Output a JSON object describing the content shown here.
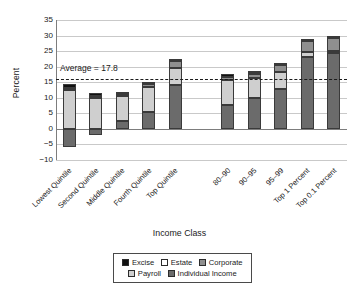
{
  "chart_data": {
    "type": "bar",
    "subtype": "stacked-bar",
    "title": "",
    "xlabel": "Income Class",
    "ylabel": "Percent",
    "ylim": [
      -10,
      35
    ],
    "ytick_step": 5,
    "yticks": [
      "35",
      "30",
      "25",
      "20",
      "15",
      "10",
      "5",
      "0",
      "-5",
      "-10"
    ],
    "grid": true,
    "legend_position": "bottom",
    "categories": [
      "Lowest Quintile",
      "Second Quintile",
      "Middle Quintile",
      "Fourth Quintile",
      "Top Quintile",
      "80-90",
      "90-95",
      "95-99",
      "Top 1 Percent",
      "Top 0.1 Percent"
    ],
    "series": [
      {
        "name": "Individual Income",
        "color": "#6b6b6b",
        "values": [
          -5.9,
          -2.1,
          2.4,
          5.3,
          14.1,
          7.7,
          9.8,
          12.9,
          23.0,
          24.3
        ]
      },
      {
        "name": "Payroll",
        "color": "#cfcfcf",
        "values": [
          12.6,
          9.9,
          8.2,
          8.2,
          5.6,
          8.0,
          6.6,
          5.5,
          1.6,
          0.6
        ]
      },
      {
        "name": "Corporate",
        "color": "#8f8f8f",
        "values": [
          0.5,
          0.6,
          0.7,
          1.0,
          2.2,
          1.1,
          1.5,
          2.2,
          3.5,
          4.3
        ]
      },
      {
        "name": "Estate",
        "color": "#ffffff",
        "values": [
          0.0,
          0.0,
          0.0,
          0.0,
          0.2,
          0.0,
          0.1,
          0.2,
          0.5,
          0.5
        ]
      },
      {
        "name": "Excise",
        "color": "#111111",
        "values": [
          1.4,
          1.0,
          0.7,
          0.6,
          0.4,
          0.7,
          0.5,
          0.4,
          0.3,
          0.3
        ]
      }
    ],
    "totals": [
      8.6,
      9.4,
      12.0,
      15.1,
      22.5,
      17.5,
      18.5,
      21.2,
      28.9,
      30.0
    ],
    "annotations": [
      {
        "type": "hline",
        "label": "Average = 17.8",
        "value": 17.8,
        "drawn_at": 16.0,
        "style": "dashed",
        "color": "#1a1a1a"
      }
    ],
    "group_gap_after_index": 4
  },
  "axis": {
    "y_title": "Percent",
    "x_title": "Income Class"
  },
  "legend": {
    "row1": [
      {
        "label": "Excise",
        "key": "sw-excise"
      },
      {
        "label": "Estate",
        "key": "sw-estate"
      },
      {
        "label": "Corporate",
        "key": "sw-corporate"
      }
    ],
    "row2": [
      {
        "label": "Payroll",
        "key": "sw-payroll"
      },
      {
        "label": "Individual Income",
        "key": "sw-individual"
      }
    ]
  },
  "caption": {
    "text": ""
  }
}
